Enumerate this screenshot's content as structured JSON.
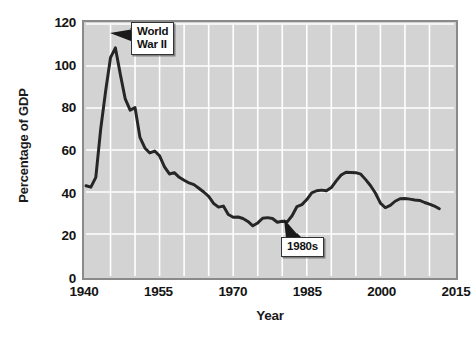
{
  "chart_data": {
    "type": "line",
    "title": "",
    "xlabel": "Year",
    "ylabel": "Percentage of GDP",
    "xlim": [
      1940,
      2015
    ],
    "ylim": [
      0,
      120
    ],
    "xticks": [
      1940,
      1955,
      1970,
      1985,
      2000,
      2015
    ],
    "xtick_labels": [
      "1940",
      "1955",
      "1970",
      "1985",
      "2000",
      "2015"
    ],
    "yticks": [
      0,
      20,
      40,
      60,
      80,
      100,
      120
    ],
    "ytick_labels": [
      "0",
      "20",
      "40",
      "60",
      "80",
      "100",
      "120"
    ],
    "grid": true,
    "grid_x_step": 5,
    "grid_y_step": 20,
    "legend": null,
    "plot_bgcolor": "#d3d3d3",
    "grid_color": "#ffffff",
    "line_color": "#262626",
    "line_width": 3,
    "series": [
      {
        "name": "Federal debt held by the public",
        "x": [
          1940,
          1941,
          1942,
          1943,
          1944,
          1945,
          1946,
          1947,
          1948,
          1949,
          1950,
          1951,
          1952,
          1953,
          1954,
          1955,
          1956,
          1957,
          1958,
          1959,
          1960,
          1961,
          1962,
          1963,
          1964,
          1965,
          1966,
          1967,
          1968,
          1969,
          1970,
          1971,
          1972,
          1973,
          1974,
          1975,
          1976,
          1977,
          1978,
          1979,
          1980,
          1981,
          1982,
          1983,
          1984,
          1985,
          1986,
          1987,
          1988,
          1989,
          1990,
          1991,
          1992,
          1993,
          1994,
          1995,
          1996,
          1997,
          1998,
          1999,
          2000,
          2001,
          2002,
          2003,
          2004,
          2005,
          2006,
          2007,
          2008,
          2009,
          2010,
          2011,
          2012
        ],
        "y": [
          43.0,
          42.3,
          47.0,
          70.0,
          88.0,
          104.0,
          108.6,
          96.0,
          84.3,
          79.0,
          80.2,
          66.0,
          61.0,
          58.6,
          59.5,
          57.2,
          52.0,
          48.6,
          49.2,
          47.0,
          45.6,
          44.3,
          43.5,
          41.8,
          40.0,
          37.9,
          34.6,
          32.8,
          33.3,
          29.3,
          28.0,
          28.1,
          27.4,
          26.0,
          23.9,
          25.3,
          27.5,
          27.8,
          27.4,
          25.6,
          26.1,
          25.8,
          28.7,
          33.1,
          34.0,
          36.4,
          39.6,
          40.6,
          40.9,
          40.6,
          42.1,
          45.3,
          48.1,
          49.4,
          49.3,
          49.2,
          48.5,
          45.9,
          43.0,
          39.4,
          34.7,
          32.5,
          33.6,
          35.6,
          36.8,
          36.9,
          36.6,
          36.2,
          36.0,
          35.0,
          34.2,
          33.3,
          32.0
        ]
      }
    ],
    "annotations": [
      {
        "id": "world-war-ii",
        "label": "World\nWar II",
        "point_x": 1946,
        "point_y": 107,
        "box_left_px": 131,
        "box_top_px": 22
      },
      {
        "id": "nineteen-eighties",
        "label": "1980s",
        "point_x": 1983,
        "point_y": 29,
        "box_left_px": 281,
        "box_top_px": 237
      }
    ]
  },
  "axes": {
    "y_title": "Percentage of GDP",
    "x_title": "Year"
  },
  "annotations": {
    "ww2": "World\nWar II",
    "eighties": "1980s"
  }
}
